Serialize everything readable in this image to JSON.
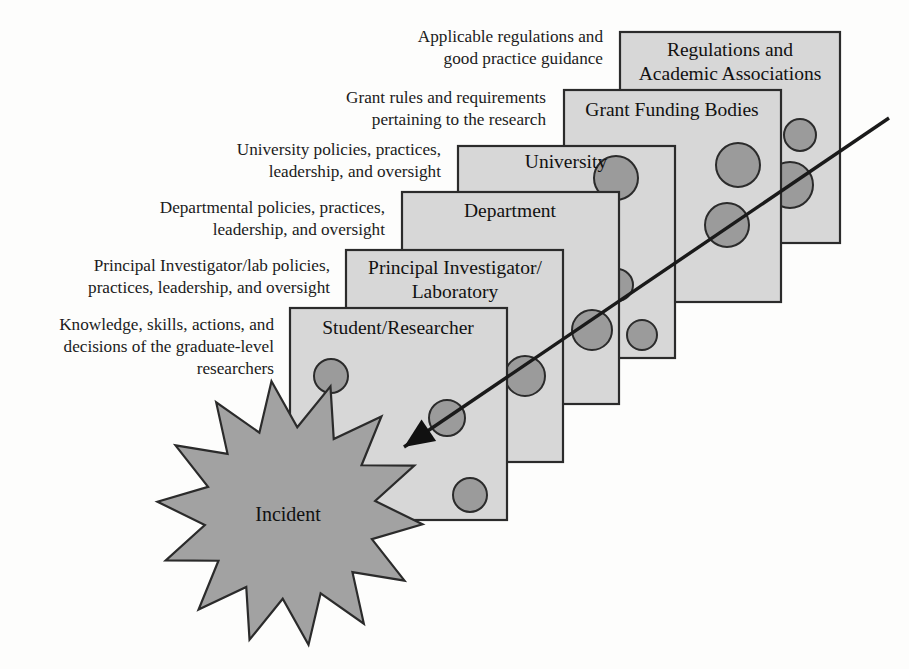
{
  "figure": {
    "type": "swiss-cheese-model-diagram",
    "title_visible": false,
    "background_color": "#fdfdfc",
    "panel_fill": "#d7d7d7",
    "panel_stroke": "#2b2b2b",
    "hole_fill": "#9b9b9b",
    "burst_fill": "#a2a2a2",
    "trajectory_color": "#1a1a1a"
  },
  "layers": [
    {
      "id": "student-researcher",
      "label_lines": [
        "Student/Researcher"
      ],
      "order": 1,
      "rect": {
        "x": 290,
        "y": 308,
        "w": 217,
        "h": 212
      },
      "label_xy": {
        "x": 398,
        "y": 334
      },
      "holes": [
        {
          "cx": 331,
          "cy": 376,
          "r": 17
        },
        {
          "cx": 447,
          "cy": 418,
          "r": 18
        },
        {
          "cx": 470,
          "cy": 495,
          "r": 17
        }
      ]
    },
    {
      "id": "principal-investigator-laboratory",
      "label_lines": [
        "Principal Investigator/",
        "Laboratory"
      ],
      "order": 2,
      "rect": {
        "x": 346,
        "y": 250,
        "w": 217,
        "h": 212
      },
      "label_xy": {
        "x": 455,
        "y": 274
      },
      "holes": [
        {
          "cx": 388,
          "cy": 330,
          "r": 16
        },
        {
          "cx": 392,
          "cy": 368,
          "r": 15
        },
        {
          "cx": 525,
          "cy": 376,
          "r": 20
        }
      ]
    },
    {
      "id": "department",
      "label_lines": [
        "Department"
      ],
      "order": 3,
      "rect": {
        "x": 402,
        "y": 192,
        "w": 217,
        "h": 212
      },
      "label_xy": {
        "x": 510,
        "y": 217
      },
      "holes": [
        {
          "cx": 495,
          "cy": 312,
          "r": 16
        },
        {
          "cx": 592,
          "cy": 330,
          "r": 20
        },
        {
          "cx": 642,
          "cy": 335,
          "r": 15
        }
      ]
    },
    {
      "id": "university",
      "label_lines": [
        "University"
      ],
      "order": 4,
      "rect": {
        "x": 458,
        "y": 146,
        "w": 217,
        "h": 212
      },
      "label_xy": {
        "x": 566,
        "y": 168
      },
      "holes": [
        {
          "cx": 616,
          "cy": 178,
          "r": 22
        },
        {
          "cx": 617,
          "cy": 285,
          "r": 16
        },
        {
          "cx": 595,
          "cy": 330,
          "r": 20
        }
      ]
    },
    {
      "id": "grant-funding-bodies",
      "label_lines": [
        "Grant Funding Bodies"
      ],
      "order": 5,
      "rect": {
        "x": 564,
        "y": 90,
        "w": 217,
        "h": 212
      },
      "label_xy": {
        "x": 672,
        "y": 116
      },
      "holes": [
        {
          "cx": 738,
          "cy": 165,
          "r": 22
        },
        {
          "cx": 727,
          "cy": 225,
          "r": 22
        }
      ]
    },
    {
      "id": "regulations-academic-associations",
      "label_lines": [
        "Regulations and",
        "Academic Associations"
      ],
      "order": 6,
      "rect": {
        "x": 620,
        "y": 32,
        "w": 220,
        "h": 211
      },
      "label_xy": {
        "x": 730,
        "y": 56
      },
      "holes": [
        {
          "cx": 800,
          "cy": 135,
          "r": 16
        },
        {
          "cx": 790,
          "cy": 185,
          "r": 23
        }
      ]
    }
  ],
  "callouts": [
    {
      "id": "callout-regulations",
      "lines": [
        "Applicable regulations and",
        "good practice guidance"
      ],
      "anchor_xy": {
        "x": 603,
        "y": 42
      }
    },
    {
      "id": "callout-grant",
      "lines": [
        "Grant rules and requirements",
        "pertaining to the research"
      ],
      "anchor_xy": {
        "x": 546,
        "y": 103
      }
    },
    {
      "id": "callout-university",
      "lines": [
        "University policies, practices,",
        "leadership, and oversight"
      ],
      "anchor_xy": {
        "x": 441,
        "y": 155
      }
    },
    {
      "id": "callout-department",
      "lines": [
        "Departmental policies, practices,",
        "leadership, and oversight"
      ],
      "anchor_xy": {
        "x": 385,
        "y": 213
      }
    },
    {
      "id": "callout-pi",
      "lines": [
        "Principal Investigator/lab policies,",
        "practices, leadership, and oversight"
      ],
      "anchor_xy": {
        "x": 330,
        "y": 271
      }
    },
    {
      "id": "callout-student",
      "lines": [
        "Knowledge, skills, actions, and",
        "decisions of the graduate-level",
        "researchers"
      ],
      "anchor_xy": {
        "x": 274,
        "y": 330
      }
    }
  ],
  "burst": {
    "id": "incident-burst",
    "label": "Incident",
    "center": {
      "cx": 290,
      "cy": 513
    },
    "outer_r": 133,
    "inner_r": 86,
    "points": 14,
    "rotation_deg": -8,
    "label_xy": {
      "x": 288,
      "y": 521
    }
  },
  "trajectory": {
    "id": "accident-trajectory",
    "description": "hazard path through aligned holes",
    "start": {
      "x": 889,
      "y": 118
    },
    "end": {
      "x": 404,
      "y": 447
    },
    "arrowhead_at": {
      "x": 404,
      "y": 447
    },
    "arrowhead_angle_deg": 214
  }
}
